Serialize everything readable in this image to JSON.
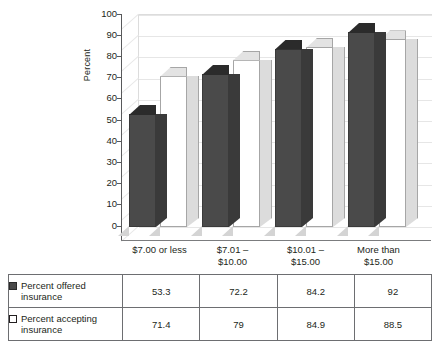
{
  "chart_data": {
    "type": "bar",
    "title": "",
    "xlabel": "",
    "ylabel": "Percent",
    "ylim": [
      0,
      100
    ],
    "ytick_step": 10,
    "yticks": [
      "100",
      "90",
      "80",
      "70",
      "60",
      "50",
      "40",
      "30",
      "20",
      "10",
      "0"
    ],
    "grid": true,
    "legend_position": "table-below",
    "style": "3d-column",
    "categories": [
      "$7.00 or less",
      "$7.01 –\n$10.00",
      "$10.01 –\n$15.00",
      "More than\n$15.00"
    ],
    "category_lines": [
      [
        "$7.00 or less"
      ],
      [
        "$7.01 –",
        "$10.00"
      ],
      [
        "$10.01 –",
        "$15.00"
      ],
      [
        "More than",
        "$15.00"
      ]
    ],
    "series": [
      {
        "name": "Percent offered insurance",
        "swatch": "dark",
        "color": "#4a4a4a",
        "values": [
          53.3,
          72.2,
          84.2,
          92
        ],
        "value_labels": [
          "53.3",
          "72.2",
          "84.2",
          "92"
        ]
      },
      {
        "name": "Percent accepting insurance",
        "swatch": "light",
        "color": "#ffffff",
        "values": [
          71.4,
          79,
          84.9,
          88.5
        ],
        "value_labels": [
          "71.4",
          "79",
          "84.9",
          "88.5"
        ]
      }
    ]
  },
  "axis": {
    "y_label": "Percent"
  },
  "legend_table": {
    "rows": [
      {
        "swatch": "dark",
        "label_line1": "Percent offered",
        "label_line2": "insurance",
        "values": [
          "53.3",
          "72.2",
          "84.2",
          "92"
        ]
      },
      {
        "swatch": "light",
        "label_line1": "Percent accepting",
        "label_line2": "insurance",
        "values": [
          "71.4",
          "79",
          "84.9",
          "88.5"
        ]
      }
    ]
  }
}
